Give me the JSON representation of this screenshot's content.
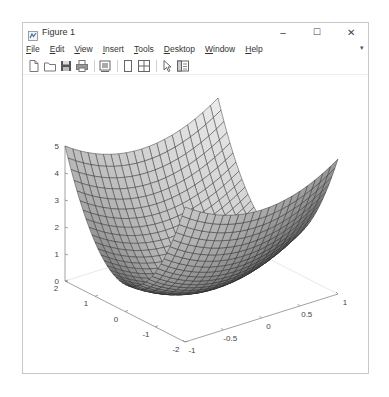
{
  "window": {
    "title": "Figure 1",
    "controls": {
      "minimize": "–",
      "maximize": "☐",
      "close": "✕"
    }
  },
  "menubar": {
    "items": [
      {
        "label": "File",
        "mnemonic": "F"
      },
      {
        "label": "Edit",
        "mnemonic": "E"
      },
      {
        "label": "View",
        "mnemonic": "V"
      },
      {
        "label": "Insert",
        "mnemonic": "I"
      },
      {
        "label": "Tools",
        "mnemonic": "T"
      },
      {
        "label": "Desktop",
        "mnemonic": "D"
      },
      {
        "label": "Window",
        "mnemonic": "W"
      },
      {
        "label": "Help",
        "mnemonic": "H"
      }
    ],
    "overflow_arrow": "▾"
  },
  "toolbar": {
    "buttons": [
      {
        "name": "new-figure",
        "icon": "new-file-icon"
      },
      {
        "name": "open-file",
        "icon": "open-folder-icon"
      },
      {
        "name": "save-figure",
        "icon": "save-icon"
      },
      {
        "name": "print-figure",
        "icon": "print-icon"
      },
      {
        "name": "link-plot",
        "icon": "link-plot-icon"
      },
      {
        "name": "insert-colorbar",
        "icon": "colorbar-icon"
      },
      {
        "name": "insert-legend",
        "icon": "legend-icon"
      },
      {
        "name": "edit-plot",
        "icon": "pointer-icon"
      },
      {
        "name": "property-inspector",
        "icon": "property-inspector-icon"
      }
    ]
  },
  "colors": {
    "surface_light": "#f2f2f2",
    "surface_dark": "#6e6e6e",
    "edge": "#2b2b2b",
    "axis": "#8a8a8a",
    "tick_label": "#444444"
  },
  "chart_data": {
    "type": "surface",
    "title": "",
    "xlabel": "",
    "ylabel": "",
    "zlabel": "",
    "function": "z = x^2 + y^2",
    "x": {
      "min": -1,
      "max": 1,
      "step": 0.1,
      "ticks": [
        -1,
        -0.5,
        0,
        0.5,
        1
      ],
      "tick_labels": [
        "-1",
        "-0.5",
        "0",
        "0.5",
        "1"
      ]
    },
    "y": {
      "min": -2,
      "max": 2,
      "step": 0.1,
      "ticks": [
        -2,
        -1,
        0,
        1,
        2
      ],
      "tick_labels": [
        "-2",
        "-1",
        "0",
        "1",
        "2"
      ]
    },
    "z": {
      "min": 0,
      "max": 5,
      "ticks": [
        0,
        1,
        2,
        3,
        4,
        5
      ],
      "tick_labels": [
        "0",
        "1",
        "2",
        "3",
        "4",
        "5"
      ]
    },
    "xlim": [
      -1,
      1
    ],
    "ylim": [
      -2,
      2
    ],
    "zlim": [
      0,
      5
    ],
    "grid": false,
    "colormap": "gray",
    "edge_color": "black",
    "legend": null
  }
}
